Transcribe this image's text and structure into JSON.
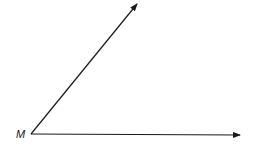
{
  "diagram": {
    "type": "angle",
    "vertex": {
      "label": "M",
      "x": 31,
      "y": 134
    },
    "rays": [
      {
        "name": "upper-ray",
        "from": [
          31,
          134
        ],
        "to": [
          138,
          3
        ]
      },
      {
        "name": "horizontal-ray",
        "from": [
          31,
          134
        ],
        "to": [
          241,
          135
        ]
      }
    ],
    "colors": {
      "stroke": "#1a1a1a",
      "background": "#ffffff"
    }
  }
}
